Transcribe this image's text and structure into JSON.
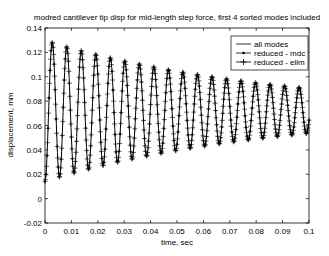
{
  "chart_data": {
    "type": "line",
    "title": "modred cantilever tip disp for mid-length step force, first 4 sorted modes included",
    "xlabel": "time, sec",
    "ylabel": "displacement, mm",
    "xlim": [
      0,
      0.1
    ],
    "ylim": [
      -0.02,
      0.14
    ],
    "xticks": [
      "0",
      "0.01",
      "0.02",
      "0.03",
      "0.04",
      "0.05",
      "0.06",
      "0.07",
      "0.08",
      "0.09",
      "0.1"
    ],
    "yticks": [
      "-0.02",
      "0",
      "0.02",
      "0.04",
      "0.06",
      "0.08",
      "0.1",
      "0.12",
      "0.14"
    ],
    "grid": false,
    "legend_position": "upper right",
    "legend": [
      "all modes",
      "reduced - mdc",
      "reduced - elim"
    ],
    "signal_model": {
      "description": "damped oscillation starting at 0, settling toward ~0.072",
      "mean": 0.072,
      "initial_amplitude": 0.058,
      "period_sec": 0.0055,
      "decay_per_sec": 11.5
    },
    "peaks": [
      {
        "x": 0.0037,
        "y": 0.126
      },
      {
        "x": 0.0092,
        "y": 0.119
      },
      {
        "x": 0.0147,
        "y": 0.114
      },
      {
        "x": 0.0202,
        "y": 0.11
      },
      {
        "x": 0.0257,
        "y": 0.106
      },
      {
        "x": 0.0312,
        "y": 0.103
      },
      {
        "x": 0.0367,
        "y": 0.1
      },
      {
        "x": 0.0422,
        "y": 0.098
      },
      {
        "x": 0.0477,
        "y": 0.096
      },
      {
        "x": 0.0532,
        "y": 0.094
      },
      {
        "x": 0.0587,
        "y": 0.093
      },
      {
        "x": 0.0642,
        "y": 0.092
      },
      {
        "x": 0.0697,
        "y": 0.091
      },
      {
        "x": 0.0752,
        "y": 0.09
      },
      {
        "x": 0.0807,
        "y": 0.089
      },
      {
        "x": 0.0862,
        "y": 0.088
      },
      {
        "x": 0.0917,
        "y": 0.088
      },
      {
        "x": 0.0972,
        "y": 0.087
      }
    ],
    "troughs": [
      {
        "x": 0.0065,
        "y": 0.012
      },
      {
        "x": 0.012,
        "y": 0.022
      },
      {
        "x": 0.0175,
        "y": 0.028
      },
      {
        "x": 0.023,
        "y": 0.034
      },
      {
        "x": 0.0285,
        "y": 0.038
      },
      {
        "x": 0.034,
        "y": 0.042
      },
      {
        "x": 0.0395,
        "y": 0.045
      },
      {
        "x": 0.045,
        "y": 0.047
      },
      {
        "x": 0.0505,
        "y": 0.049
      },
      {
        "x": 0.056,
        "y": 0.051
      },
      {
        "x": 0.0615,
        "y": 0.053
      },
      {
        "x": 0.067,
        "y": 0.054
      },
      {
        "x": 0.0725,
        "y": 0.055
      },
      {
        "x": 0.078,
        "y": 0.056
      },
      {
        "x": 0.0835,
        "y": 0.057
      },
      {
        "x": 0.089,
        "y": 0.058
      },
      {
        "x": 0.0945,
        "y": 0.058
      }
    ],
    "final_value": {
      "x": 0.1,
      "y": 0.054
    },
    "series": [
      {
        "name": "all modes",
        "style": "solid line",
        "color": "#000000"
      },
      {
        "name": "reduced - mdc",
        "style": "line with dot markers",
        "color": "#000000"
      },
      {
        "name": "reduced - elim",
        "style": "line with plus markers",
        "color": "#000000"
      }
    ]
  }
}
